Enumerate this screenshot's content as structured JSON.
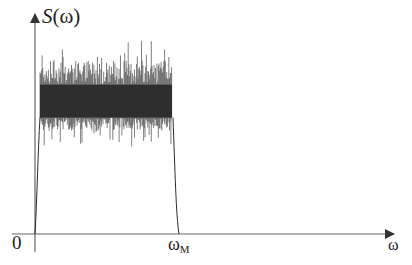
{
  "chart_data": {
    "type": "area",
    "title": "",
    "ylabel": "S(ω)",
    "ylabel_italic_part": "S",
    "ylabel_arg": "(ω)",
    "xlabel": "ω",
    "origin_label": "0",
    "x_marker": {
      "label": "ω",
      "subscript": "М",
      "position": "band upper edge"
    },
    "axes": {
      "x_arrow": true,
      "y_arrow": true,
      "grid": false,
      "ticks": false
    },
    "band": {
      "start_fraction": 0.0,
      "end_fraction": 1.0,
      "x_start": 0,
      "x_end": "ω_M"
    },
    "levels_relative": {
      "mean": 0.72,
      "dense_upper": 0.77,
      "dense_lower": 0.6,
      "peak_max": 1.0,
      "trough_min": 0.45
    },
    "colors": {
      "line": "#2a2a2a",
      "fill": "#3a3a3a",
      "axis": "#555555"
    }
  }
}
